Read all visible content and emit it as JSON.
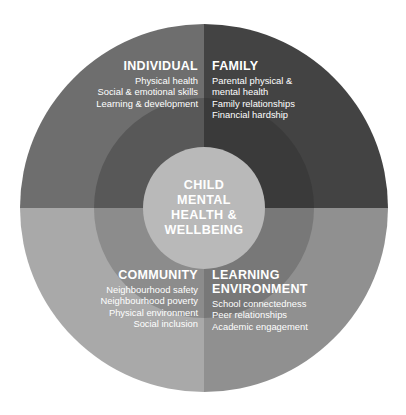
{
  "diagram": {
    "type": "concentric-quadrant-wheel",
    "center": {
      "label": "CHILD\nMENTAL\nHEALTH &\nWELLBEING",
      "fill": "#b9b9b9",
      "text_color": "#ffffff"
    },
    "geometry": {
      "center_x": 204,
      "center_y": 208,
      "outer_radius": 184,
      "middle_radius": 110,
      "hub_radius": 61
    },
    "quadrants": [
      {
        "id": "individual",
        "position": "top-left",
        "title": "INDIVIDUAL",
        "align": "right",
        "items": [
          "Physical health",
          "Social & emotional skills",
          "Learning & development"
        ],
        "outer_fill": "#6e6e6e",
        "inner_fill": "#585858"
      },
      {
        "id": "family",
        "position": "top-right",
        "title": "FAMILY",
        "align": "left",
        "items": [
          "Parental physical &",
          "mental health",
          "Family relationships",
          "Financial hardship"
        ],
        "outer_fill": "#434343",
        "inner_fill": "#3a3a3a"
      },
      {
        "id": "community",
        "position": "bottom-left",
        "title": "COMMUNITY",
        "align": "right",
        "items": [
          "Neighbourhood safety",
          "Neighbourhood poverty",
          "Physical environment",
          "Social inclusion"
        ],
        "outer_fill": "#a9a9a9",
        "inner_fill": "#8c8c8c"
      },
      {
        "id": "learning",
        "position": "bottom-right",
        "title": "LEARNING\nENVIRONMENT",
        "align": "left",
        "items": [
          "School connectedness",
          "Peer relationships",
          "Academic engagement"
        ],
        "outer_fill": "#909090",
        "inner_fill": "#787878"
      }
    ],
    "background": "#ffffff"
  }
}
